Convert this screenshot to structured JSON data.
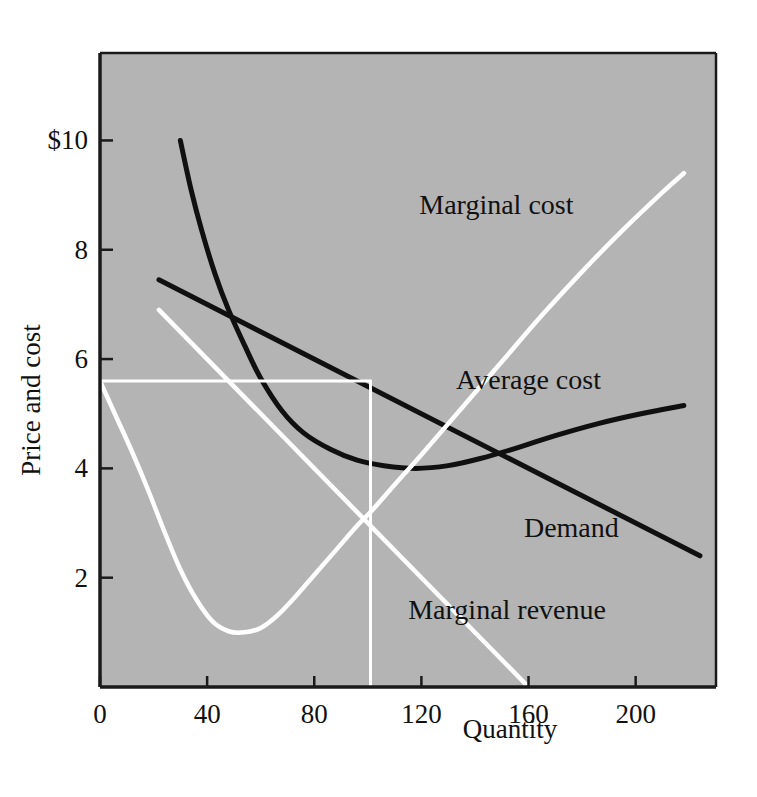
{
  "figure": {
    "background_color": "#ffffff",
    "plot_background_color": "#b4b4b4",
    "frame_color": "#1a1a1a",
    "black_curve_color": "#101010",
    "white_curve_color": "#ffffff"
  },
  "chart_data": {
    "type": "line",
    "title": "",
    "subtitle": "",
    "xlabel": "Quantity",
    "ylabel": "Price and cost",
    "xlim": [
      0,
      230
    ],
    "ylim": [
      0,
      11.6
    ],
    "xticks": [
      0,
      40,
      80,
      120,
      160,
      200
    ],
    "xtick_labels": [
      "0",
      "40",
      "80",
      "120",
      "160",
      "200"
    ],
    "yticks": [
      2,
      4,
      6,
      8,
      10
    ],
    "ytick_labels": [
      "2",
      "4",
      "6",
      "8",
      "$10"
    ],
    "grid": false,
    "legend": "inline-annotations",
    "annotations": [
      {
        "text": "Marginal cost",
        "x": 148,
        "y": 8.65,
        "color": "#111111"
      },
      {
        "text": "Average cost",
        "x": 160,
        "y": 5.45,
        "color": "#111111"
      },
      {
        "text": "Demand",
        "x": 176,
        "y": 2.75,
        "color": "#111111"
      },
      {
        "text": "Marginal revenue",
        "x": 152,
        "y": 1.25,
        "color": "#111111"
      }
    ],
    "series": [
      {
        "name": "Average cost",
        "color": "#101010",
        "style": "solid-curve",
        "points": [
          [
            30,
            10.0
          ],
          [
            34,
            9.1
          ],
          [
            38,
            8.35
          ],
          [
            43,
            7.55
          ],
          [
            48,
            6.9
          ],
          [
            54,
            6.25
          ],
          [
            60,
            5.65
          ],
          [
            68,
            5.05
          ],
          [
            76,
            4.65
          ],
          [
            86,
            4.35
          ],
          [
            96,
            4.15
          ],
          [
            106,
            4.05
          ],
          [
            118,
            4.0
          ],
          [
            130,
            4.05
          ],
          [
            142,
            4.18
          ],
          [
            156,
            4.38
          ],
          [
            170,
            4.6
          ],
          [
            186,
            4.82
          ],
          [
            202,
            5.0
          ],
          [
            218,
            5.15
          ]
        ]
      },
      {
        "name": "Demand",
        "color": "#101010",
        "style": "solid-line",
        "points": [
          [
            22,
            7.45
          ],
          [
            224,
            2.4
          ]
        ]
      },
      {
        "name": "Marginal cost",
        "color": "#ffffff",
        "style": "solid-curve",
        "points": [
          [
            0,
            5.6
          ],
          [
            6,
            4.95
          ],
          [
            12,
            4.3
          ],
          [
            18,
            3.6
          ],
          [
            24,
            2.85
          ],
          [
            30,
            2.15
          ],
          [
            36,
            1.6
          ],
          [
            42,
            1.2
          ],
          [
            48,
            1.02
          ],
          [
            54,
            1.0
          ],
          [
            60,
            1.08
          ],
          [
            66,
            1.3
          ],
          [
            72,
            1.6
          ],
          [
            80,
            2.05
          ],
          [
            88,
            2.5
          ],
          [
            96,
            2.95
          ],
          [
            101,
            3.2
          ],
          [
            110,
            3.7
          ],
          [
            120,
            4.25
          ],
          [
            135,
            5.1
          ],
          [
            150,
            5.95
          ],
          [
            165,
            6.8
          ],
          [
            180,
            7.6
          ],
          [
            195,
            8.35
          ],
          [
            210,
            9.05
          ],
          [
            218,
            9.4
          ]
        ]
      },
      {
        "name": "Marginal revenue",
        "color": "#ffffff",
        "style": "solid-line",
        "points": [
          [
            22,
            6.9
          ],
          [
            160,
            0.0
          ]
        ]
      },
      {
        "name": "Monopoly price guide",
        "color": "#ffffff",
        "style": "guide-horizontal",
        "points": [
          [
            0,
            5.6
          ],
          [
            101,
            5.6
          ]
        ]
      },
      {
        "name": "Monopoly quantity guide",
        "color": "#ffffff",
        "style": "guide-vertical",
        "points": [
          [
            101,
            5.6
          ],
          [
            101,
            0.0
          ]
        ]
      }
    ],
    "key_points": {
      "monopoly_quantity": 101,
      "monopoly_price": 5.6,
      "mr_equals_mc_price": 2.87,
      "average_cost_minimum_quantity": 118,
      "average_cost_minimum_value": 4.0
    }
  }
}
